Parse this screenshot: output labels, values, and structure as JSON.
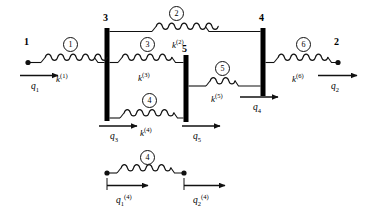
{
  "figure": {
    "colors": {
      "stroke": "#111111",
      "bar": "#000000",
      "background": "#ffffff"
    },
    "nodes": [
      {
        "id": "n1",
        "label": "1",
        "x": 28,
        "y": 62,
        "type": "point"
      },
      {
        "id": "n2",
        "label": "2",
        "x": 338,
        "y": 62,
        "type": "point"
      },
      {
        "id": "n3",
        "label": "3",
        "x": 107,
        "y": 74,
        "type": "rigid-bar"
      },
      {
        "id": "n4",
        "label": "4",
        "x": 263,
        "y": 61,
        "type": "rigid-bar"
      },
      {
        "id": "n5",
        "label": "5",
        "x": 186,
        "y": 88,
        "type": "rigid-bar"
      }
    ],
    "elements": [
      {
        "number": "1",
        "stiffness_base": "k",
        "stiffness_sup": "(1)"
      },
      {
        "number": "2",
        "stiffness_base": "k",
        "stiffness_sup": "(2)"
      },
      {
        "number": "3",
        "stiffness_base": "k",
        "stiffness_sup": "(3)"
      },
      {
        "number": "4",
        "stiffness_base": "k",
        "stiffness_sup": "(4)"
      },
      {
        "number": "5",
        "stiffness_base": "k",
        "stiffness_sup": "(5)"
      },
      {
        "number": "6",
        "stiffness_base": "k",
        "stiffness_sup": "(6)"
      }
    ],
    "dofs": [
      {
        "base": "q",
        "sub": "1",
        "sup": ""
      },
      {
        "base": "q",
        "sub": "2",
        "sup": ""
      },
      {
        "base": "q",
        "sub": "3",
        "sup": ""
      },
      {
        "base": "q",
        "sub": "4",
        "sup": ""
      },
      {
        "base": "q",
        "sub": "5",
        "sup": ""
      }
    ],
    "detail": {
      "element_number": "4",
      "dof_left": {
        "base": "q",
        "sub": "1",
        "sup": "(4)"
      },
      "dof_right": {
        "base": "q",
        "sub": "2",
        "sup": "(4)"
      }
    }
  }
}
